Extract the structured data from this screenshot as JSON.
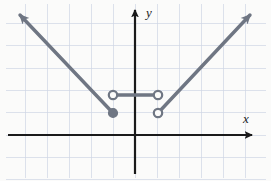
{
  "figure": {
    "kind": "cartesian-graph",
    "title": "",
    "background_color": "#fbfbfa",
    "width": 271,
    "height": 181
  },
  "axes": {
    "x_label": "x",
    "y_label": "y",
    "origin_px": [
      135,
      135
    ],
    "grid_spacing_px": 22,
    "axis_color": "#1a1a1a",
    "axis_width_px": 2.2,
    "x_axis": {
      "y_px": 135,
      "x_start_px": 8,
      "x_end_px": 252,
      "arrow": "right"
    },
    "y_axis": {
      "x_px": 135,
      "y_start_px": 174,
      "y_end_px": 10,
      "arrow": "up"
    }
  },
  "grid": {
    "show": true,
    "color": "#cfd6e4",
    "accent_color": "#e3cdd4",
    "line_width_px": 0.7,
    "vertical_x_px": [
      25,
      47,
      69,
      91,
      113,
      135,
      157,
      179,
      201,
      223,
      245
    ],
    "horizontal_y_px": [
      23,
      45,
      68,
      90,
      112,
      135,
      157,
      179
    ]
  },
  "chart_data": {
    "type": "line",
    "xlabel": "x",
    "ylabel": "y",
    "grid": true,
    "legend": "none",
    "xlim": [
      -5.8,
      5.3
    ],
    "ylim": [
      -2.0,
      5.7
    ],
    "series": [
      {
        "name": "left-ray",
        "style": "solid",
        "color": "#6f7683",
        "arrow_end": "start",
        "closed_endpoint": [
          -1,
          1
        ],
        "points_px": [
          [
            113,
            113
          ],
          [
            20,
            15
          ]
        ],
        "points_data": [
          [
            -1,
            1
          ],
          [
            -5.2,
            5.5
          ]
        ]
      },
      {
        "name": "middle-segment",
        "style": "solid",
        "color": "#6f7683",
        "arrow_end": "none",
        "open_endpoints": [
          [
            -1,
            2
          ],
          [
            1,
            2
          ]
        ],
        "points_px": [
          [
            113,
            95
          ],
          [
            158,
            95
          ]
        ],
        "points_data": [
          [
            -1,
            2
          ],
          [
            1,
            2
          ]
        ]
      },
      {
        "name": "right-ray",
        "style": "solid",
        "color": "#6f7683",
        "arrow_end": "end",
        "open_endpoint": [
          1,
          1
        ],
        "points_px": [
          [
            158,
            113
          ],
          [
            250,
            15
          ]
        ],
        "points_data": [
          [
            1,
            1
          ],
          [
            5.2,
            5.5
          ]
        ]
      }
    ],
    "markers": [
      {
        "name": "filled-point-left",
        "fill": "closed",
        "x_px": 113,
        "y_px": 113,
        "x": -1,
        "y": 1,
        "radius_px": 4.4
      },
      {
        "name": "open-point-upper-left",
        "fill": "open",
        "x_px": 113,
        "y_px": 95,
        "x": -1,
        "y": 2,
        "radius_px": 4.2
      },
      {
        "name": "open-point-upper-right",
        "fill": "open",
        "x_px": 158,
        "y_px": 95,
        "x": 1,
        "y": 2,
        "radius_px": 4.2
      },
      {
        "name": "open-point-lower-right",
        "fill": "open",
        "x_px": 158,
        "y_px": 113,
        "x": 1,
        "y": 1,
        "radius_px": 4.2
      }
    ]
  },
  "colors": {
    "curve": "#6f7683",
    "axis": "#1a1a1a",
    "grid": "#cfd6e4",
    "grid_accent": "#e3cdd4",
    "marker_fill": "#6f7683",
    "marker_open_fill": "#fbfbfa"
  }
}
